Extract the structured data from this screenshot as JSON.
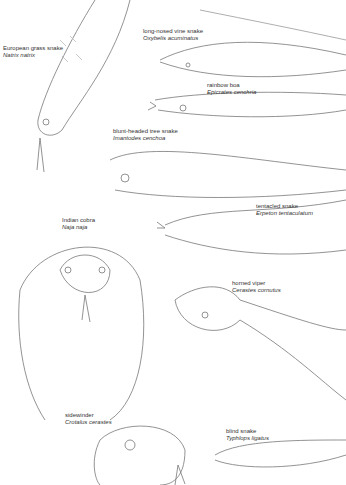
{
  "page": {
    "background": "#ffffff",
    "line_color": "#666666"
  },
  "labels": [
    {
      "common": "European grass snake",
      "scientific": "Natrix natrix"
    },
    {
      "common": "long-nosed vine snake",
      "scientific": "Oxybelis acuminatus"
    },
    {
      "common": "rainbow boa",
      "scientific": "Epicrates cenchria"
    },
    {
      "common": "blunt-headed tree snake",
      "scientific": "Imantodes cenchoa"
    },
    {
      "common": "tentacled snake",
      "scientific": "Erpeton tentaculatum"
    },
    {
      "common": "Indian cobra",
      "scientific": "Naja naja"
    },
    {
      "common": "horned viper",
      "scientific": "Cerastes cornutus"
    },
    {
      "common": "sidewinder",
      "scientific": "Crotalus cerastes"
    },
    {
      "common": "blind snake",
      "scientific": "Typhlops ligatus"
    }
  ]
}
